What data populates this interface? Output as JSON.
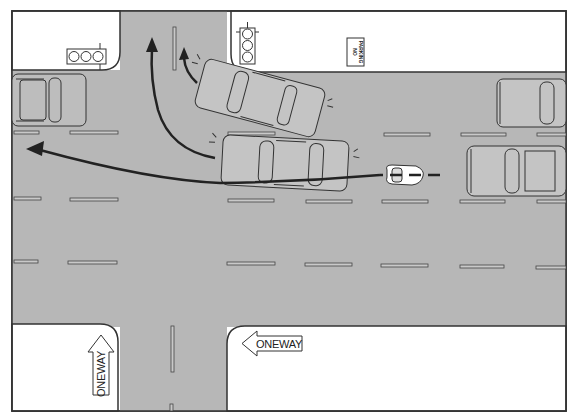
{
  "scene": {
    "type": "traffic-intersection-diagram",
    "colors": {
      "road": "#b7b7b7",
      "sidewalk": "#ffffff",
      "outline": "#333333",
      "path_line": "#222222"
    }
  },
  "signs": {
    "no_parking": {
      "line1": "NO",
      "line2": "PARKING"
    },
    "one_way_left": {
      "label": "ONEWAY"
    },
    "one_way_up": {
      "label": "ONEWAY"
    }
  },
  "elements": {
    "traffic_lights": [
      "traffic-light-horizontal-left",
      "traffic-light-vertical-right"
    ],
    "vehicles": [
      "parked-car-left",
      "turning-car-angled",
      "car-center-lane",
      "motorcycle",
      "parked-car-right-top",
      "car-right-lower"
    ],
    "paths": [
      "left-turn-path",
      "straight-path-left",
      "short-turn-path"
    ]
  }
}
